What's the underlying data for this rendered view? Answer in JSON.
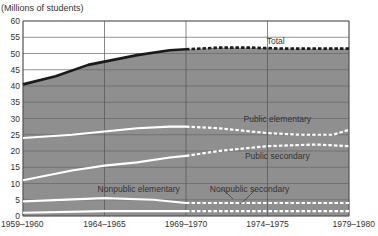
{
  "chart_data": {
    "type": "line",
    "title": "",
    "ylabel": "(Millions of students)",
    "xlabel": "",
    "ylim": [
      0,
      60
    ],
    "xlim": [
      1959,
      1979
    ],
    "y_ticks": [
      0,
      5,
      10,
      15,
      20,
      25,
      30,
      35,
      40,
      45,
      50,
      55,
      60
    ],
    "x_ticks": [
      {
        "year": 1959,
        "label": "1959–1960"
      },
      {
        "year": 1964,
        "label": "1964–1965"
      },
      {
        "year": 1969,
        "label": "1969–1970"
      },
      {
        "year": 1974,
        "label": "1974–1975"
      },
      {
        "year": 1979,
        "label": "1979–1980"
      }
    ],
    "grid": true,
    "projection_start": 1969,
    "legend_position": "inline labels",
    "series": [
      {
        "name": "Total",
        "color": "#1a1a1a",
        "x": [
          1959,
          1961,
          1963,
          1964,
          1966,
          1968,
          1969,
          1971,
          1973,
          1975,
          1977,
          1979
        ],
        "values": [
          40.5,
          43,
          46.5,
          47.5,
          49.5,
          51,
          51.3,
          51.8,
          51.8,
          51.5,
          51.5,
          51.5
        ],
        "label_pos": [
          1974.5,
          53
        ]
      },
      {
        "name": "Public elementary",
        "color": "#ffffff",
        "x": [
          1959,
          1962,
          1964,
          1966,
          1968,
          1969,
          1971,
          1973,
          1974,
          1976,
          1978,
          1979
        ],
        "values": [
          24,
          25,
          26,
          27,
          27.5,
          27.5,
          27,
          26,
          25.5,
          25,
          25,
          26.5
        ],
        "label_pos": [
          1974.6,
          28.8
        ]
      },
      {
        "name": "Public secondary",
        "color": "#ffffff",
        "x": [
          1959,
          1962,
          1964,
          1966,
          1968,
          1969,
          1971,
          1973,
          1974,
          1977,
          1979
        ],
        "values": [
          11,
          14,
          15.5,
          16.5,
          18,
          18.5,
          20,
          21,
          21.5,
          22,
          21.5
        ],
        "label_pos": [
          1974.6,
          17.5
        ]
      },
      {
        "name": "Nonpublic elementary",
        "color": "#ffffff",
        "x": [
          1959,
          1964,
          1967,
          1969,
          1974,
          1979
        ],
        "values": [
          4.5,
          5.5,
          5,
          4,
          4,
          4
        ],
        "label_pos": [
          1966.1,
          7.5
        ]
      },
      {
        "name": "Nonpublic secondary",
        "color": "#ffffff",
        "x": [
          1959,
          1964,
          1969,
          1974,
          1979
        ],
        "values": [
          1,
          1.5,
          1.5,
          1.5,
          1.5
        ],
        "label_pos": [
          1972.9,
          7.5
        ]
      }
    ]
  }
}
